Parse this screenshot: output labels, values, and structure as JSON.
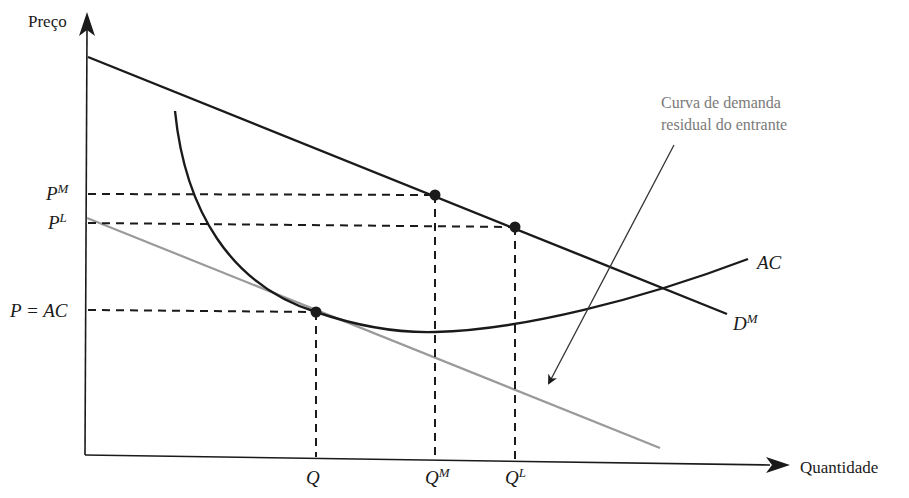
{
  "axes": {
    "y_label": "Preço",
    "x_label": "Quantidade"
  },
  "price_labels": {
    "pm": {
      "base": "P",
      "sup": "M"
    },
    "pl": {
      "base": "P",
      "sup": "L"
    },
    "pac": "P = AC"
  },
  "quantity_labels": {
    "q": "Q",
    "qm": {
      "base": "Q",
      "sup": "M"
    },
    "ql": {
      "base": "Q",
      "sup": "L"
    }
  },
  "curve_labels": {
    "ac": "AC",
    "dm": {
      "base": "D",
      "sup": "M"
    }
  },
  "annotation": {
    "line1": "Curva de demanda",
    "line2": "residual do entrante"
  },
  "colors": {
    "ink": "#1a1a1a",
    "residual_demand": "#9a9a9a",
    "annotation_text": "#7a7a7a"
  }
}
